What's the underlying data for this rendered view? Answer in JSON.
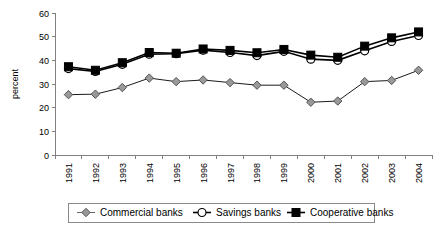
{
  "chart_data": {
    "type": "line",
    "title": "",
    "xlabel": "",
    "ylabel": "percent",
    "ylim": [
      0,
      60
    ],
    "yticks": [
      0,
      10,
      20,
      30,
      40,
      50,
      60
    ],
    "grid": false,
    "legend_position": "bottom",
    "categories": [
      "1991",
      "1992",
      "1993",
      "1994",
      "1995",
      "1996",
      "1997",
      "1998",
      "1999",
      "2000",
      "2001",
      "2002",
      "2003",
      "2004"
    ],
    "series": [
      {
        "name": "Commercial banks",
        "marker": "diamond",
        "color": "#999999",
        "values": [
          25.5,
          25.7,
          28.5,
          32.5,
          31,
          31.7,
          30.6,
          29.5,
          29.5,
          22.3,
          22.8,
          31,
          31.5,
          35.8
        ]
      },
      {
        "name": "Savings banks",
        "marker": "circle",
        "color": "#ffffff",
        "values": [
          36.5,
          35.3,
          38.3,
          42.6,
          42.8,
          44.3,
          43.3,
          42,
          43.8,
          40.5,
          40,
          44,
          48,
          50.5
        ]
      },
      {
        "name": "Cooperative banks",
        "marker": "square",
        "color": "#000000",
        "values": [
          37.3,
          35.8,
          39,
          43.3,
          43,
          44.8,
          44.2,
          43.2,
          44.6,
          42.2,
          41.3,
          46,
          49.5,
          52
        ]
      }
    ]
  },
  "legend": {
    "items": [
      {
        "label": "Commercial banks",
        "marker": "diamond"
      },
      {
        "label": "Savings banks",
        "marker": "circle"
      },
      {
        "label": "Cooperative banks",
        "marker": "square"
      }
    ]
  }
}
